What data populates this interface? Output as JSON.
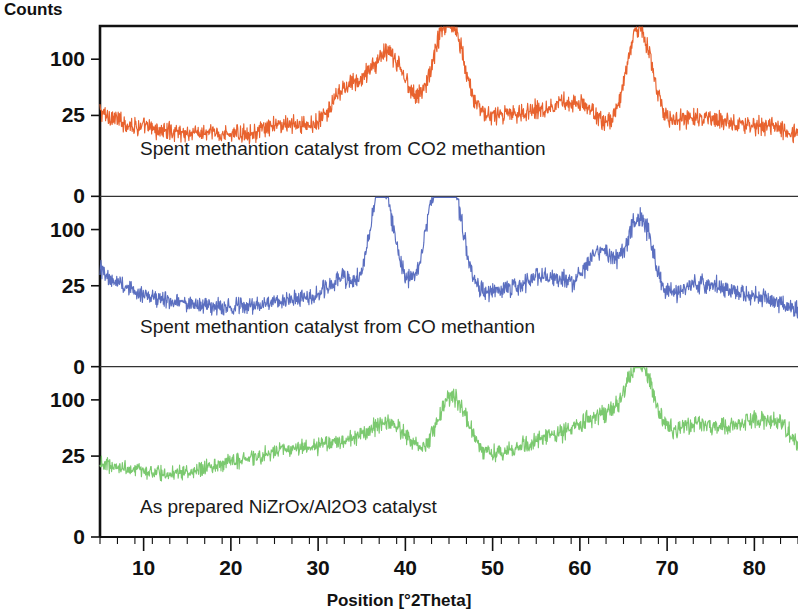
{
  "chart_data": {
    "type": "line",
    "title": "",
    "xlabel": "Position [°2Theta]",
    "ylabel": "Counts",
    "xlim": [
      5,
      85
    ],
    "grid": false,
    "legend_position": "inline-annotations",
    "xticks": [
      10,
      20,
      30,
      40,
      50,
      60,
      70,
      80
    ],
    "xtick_labels": [
      "10",
      "20",
      "30",
      "40",
      "50",
      "60",
      "70",
      "80"
    ],
    "panel_yticks": [
      100,
      25,
      0
    ],
    "panel_ytick_labels": [
      "100",
      "25",
      "0"
    ],
    "panels": [
      {
        "index": 0,
        "label": "Spent methantion catalyst from CO2 methantion",
        "color": "#E8622E",
        "ylim": [
          0,
          130
        ],
        "baseline": 42,
        "peaks": [
          {
            "position": 26.5,
            "height": 8,
            "width": 2.2
          },
          {
            "position": 31.5,
            "height": 10,
            "width": 1.6
          },
          {
            "position": 33.2,
            "height": 16,
            "width": 1.3
          },
          {
            "position": 37.2,
            "height": 52,
            "width": 2.4
          },
          {
            "position": 39.5,
            "height": 14,
            "width": 1.6
          },
          {
            "position": 43.3,
            "height": 18,
            "width": 1.4
          },
          {
            "position": 45.2,
            "height": 76,
            "width": 1.6
          },
          {
            "position": 49.0,
            "height": 10,
            "width": 2.0
          },
          {
            "position": 53.0,
            "height": 14,
            "width": 2.4
          },
          {
            "position": 57.0,
            "height": 16,
            "width": 2.2
          },
          {
            "position": 60.5,
            "height": 20,
            "width": 2.2
          },
          {
            "position": 66.8,
            "height": 82,
            "width": 1.5
          },
          {
            "position": 72.0,
            "height": 14,
            "width": 2.4
          },
          {
            "position": 76.5,
            "height": 12,
            "width": 2.6
          },
          {
            "position": 82.0,
            "height": 10,
            "width": 2.6
          }
        ],
        "noise": 7,
        "decay_start": 22,
        "decay_rate": 9
      },
      {
        "index": 1,
        "label": "Spent methantion catalyst from CO methantion",
        "color": "#5B6FC0",
        "ylim": [
          0,
          130
        ],
        "baseline": 40,
        "peaks": [
          {
            "position": 26.5,
            "height": 6,
            "width": 2.4
          },
          {
            "position": 31.5,
            "height": 10,
            "width": 1.8
          },
          {
            "position": 33.5,
            "height": 14,
            "width": 1.6
          },
          {
            "position": 37.2,
            "height": 88,
            "width": 1.2
          },
          {
            "position": 39.5,
            "height": 18,
            "width": 1.6
          },
          {
            "position": 43.3,
            "height": 66,
            "width": 1.2
          },
          {
            "position": 45.4,
            "height": 78,
            "width": 1.3
          },
          {
            "position": 49.0,
            "height": 10,
            "width": 2.2
          },
          {
            "position": 53.5,
            "height": 12,
            "width": 2.4
          },
          {
            "position": 57.5,
            "height": 22,
            "width": 2.6
          },
          {
            "position": 62.5,
            "height": 42,
            "width": 1.6
          },
          {
            "position": 66.8,
            "height": 70,
            "width": 1.5
          },
          {
            "position": 72.5,
            "height": 16,
            "width": 2.6
          },
          {
            "position": 76.5,
            "height": 14,
            "width": 2.6
          },
          {
            "position": 81.5,
            "height": 10,
            "width": 2.6
          }
        ],
        "noise": 7,
        "decay_start": 22,
        "decay_rate": 14
      },
      {
        "index": 2,
        "label": "As prepared NiZrOx/Al2O3 catalyst",
        "color": "#7BC96F",
        "ylim": [
          0,
          130
        ],
        "baseline": 42,
        "peaks": [
          {
            "position": 20.0,
            "height": 8,
            "width": 3.0
          },
          {
            "position": 26.0,
            "height": 14,
            "width": 3.0
          },
          {
            "position": 32.5,
            "height": 20,
            "width": 3.5
          },
          {
            "position": 37.5,
            "height": 22,
            "width": 2.6
          },
          {
            "position": 39.5,
            "height": 14,
            "width": 2.0
          },
          {
            "position": 45.3,
            "height": 56,
            "width": 1.8
          },
          {
            "position": 50.0,
            "height": 12,
            "width": 2.6
          },
          {
            "position": 55.0,
            "height": 18,
            "width": 3.0
          },
          {
            "position": 60.0,
            "height": 26,
            "width": 3.2
          },
          {
            "position": 63.5,
            "height": 30,
            "width": 2.4
          },
          {
            "position": 67.0,
            "height": 66,
            "width": 1.6
          },
          {
            "position": 72.0,
            "height": 34,
            "width": 3.0
          },
          {
            "position": 78.0,
            "height": 30,
            "width": 3.5
          },
          {
            "position": 83.0,
            "height": 32,
            "width": 3.0
          }
        ],
        "noise": 6,
        "decay_start": 18,
        "decay_rate": 6
      }
    ]
  },
  "axes": {
    "counts_label": "Counts",
    "position_label": "Position [°2Theta]"
  }
}
